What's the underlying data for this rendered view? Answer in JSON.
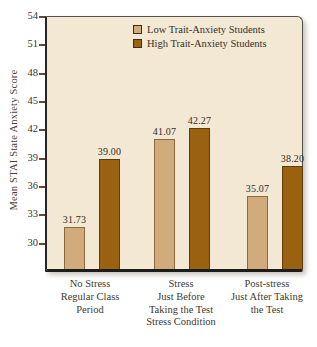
{
  "chart_data": {
    "type": "bar",
    "title": "",
    "xlabel": "Stress Condition",
    "ylabel": "Mean STAI State Anxiety Score",
    "categories": [
      [
        "No Stress",
        "Regular Class",
        "Period"
      ],
      [
        "Stress",
        "Just Before",
        "Taking the Test"
      ],
      [
        "Post-stress",
        "Just After Taking",
        "the Test"
      ]
    ],
    "series": [
      {
        "name": "Low Trait-Anxiety Students",
        "values": [
          31.73,
          41.07,
          35.07
        ],
        "labels": [
          "31.73",
          "41.07",
          "35.07"
        ],
        "color": "#d2ab7c",
        "border": "#8a6a3e"
      },
      {
        "name": "High Trait-Anxiety Students",
        "values": [
          39.0,
          42.27,
          38.2
        ],
        "labels": [
          "39.00",
          "42.27",
          "38.20"
        ],
        "color": "#9a6210",
        "border": "#5f3d08"
      }
    ],
    "yticks": [
      30,
      33,
      36,
      39,
      42,
      45,
      48,
      51,
      54
    ],
    "ylim": [
      27.3,
      54
    ],
    "legend_position": "top-right",
    "grid": false
  },
  "colors": {
    "plot_background": "#f2e8d3",
    "page_background": "#ffffff",
    "axis_line": "#1c1c1c",
    "tick_color": "#5f4a3c",
    "text": "#3b332b"
  }
}
